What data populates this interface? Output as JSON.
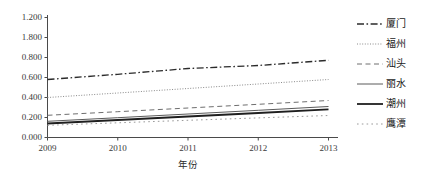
{
  "chart_data": {
    "type": "line",
    "title": "",
    "xlabel": "年份",
    "ylabel": "",
    "x": [
      2009,
      2010,
      2011,
      2012,
      2013
    ],
    "categories": [
      "2009",
      "2010",
      "2011",
      "2012",
      "2013"
    ],
    "xtick_labels": [
      "2009",
      "2010",
      "2011",
      "2012",
      "2013"
    ],
    "ytick_labels": [
      "1.200",
      "1.800",
      "0.800",
      "0.600",
      "0.400",
      "0.200",
      "0.000"
    ],
    "ytick_values": [
      1.2,
      1.0,
      0.8,
      0.6,
      0.4,
      0.2,
      0.0
    ],
    "ylim": [
      0.0,
      1.2
    ],
    "xlim": [
      2009,
      2013
    ],
    "grid": false,
    "legend_position": "right",
    "series": [
      {
        "name": "厦门",
        "style": "dash-dot",
        "color": "#2b2b2b",
        "width": 1.3,
        "values": [
          0.58,
          0.632,
          0.69,
          0.72,
          0.772
        ]
      },
      {
        "name": "福州",
        "style": "dotted-fine",
        "color": "#8a8a8a",
        "width": 1.0,
        "values": [
          0.4,
          0.445,
          0.49,
          0.535,
          0.58
        ]
      },
      {
        "name": "汕头",
        "style": "dashed",
        "color": "#6e6e6e",
        "width": 1.0,
        "values": [
          0.222,
          0.258,
          0.295,
          0.332,
          0.37
        ]
      },
      {
        "name": "丽水",
        "style": "solid-thin",
        "color": "#5a5a5a",
        "width": 1.0,
        "values": [
          0.162,
          0.198,
          0.235,
          0.272,
          0.31
        ]
      },
      {
        "name": "潮州",
        "style": "solid-thick",
        "color": "#1f1f1f",
        "width": 1.8,
        "values": [
          0.14,
          0.175,
          0.21,
          0.245,
          0.282
        ]
      },
      {
        "name": "鹰潭",
        "style": "dotted-sparse",
        "color": "#9a9a9a",
        "width": 1.0,
        "values": [
          0.122,
          0.147,
          0.172,
          0.196,
          0.22
        ]
      }
    ]
  },
  "axes": {
    "axis_color": "#4a4a4a"
  }
}
